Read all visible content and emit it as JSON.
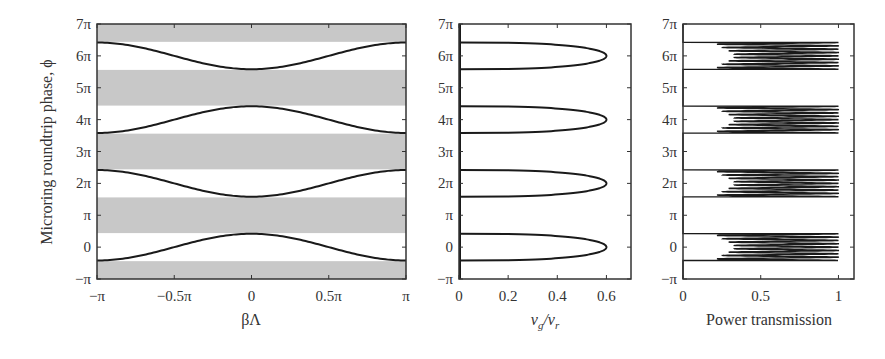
{
  "figure": {
    "ylabel": "Microring roundtrip phase, ϕ",
    "panels": [
      {
        "id": "a",
        "xlabel": "βΛ"
      },
      {
        "id": "b",
        "xlabel_main": "ν",
        "xlabel_sub1": "g",
        "xlabel_sep": "/ν",
        "xlabel_sub2": "r"
      },
      {
        "id": "c",
        "xlabel": "Power transmission"
      }
    ]
  },
  "chart_data": [
    {
      "type": "line",
      "title": "",
      "xlabel": "βΛ",
      "ylabel": "Microring roundtrip phase, ϕ",
      "xlim": [
        -3.14159,
        3.14159
      ],
      "ylim_pi": [
        -1,
        7
      ],
      "x_ticks": [
        -1,
        -0.5,
        0,
        0.5,
        1
      ],
      "x_tick_labels": [
        "−π",
        "−0.5π",
        "0",
        "0.5π",
        "π"
      ],
      "y_ticks_pi": [
        -1,
        0,
        1,
        2,
        3,
        4,
        5,
        6,
        7
      ],
      "y_tick_labels": [
        "−π",
        "0",
        "π",
        "2π",
        "3π",
        "4π",
        "5π",
        "6π",
        "7π"
      ],
      "band_gaps_shaded_pi": [
        [
          -1,
          -0.44
        ],
        [
          0.44,
          1.56
        ],
        [
          2.44,
          3.56
        ],
        [
          4.44,
          5.56
        ],
        [
          6.44,
          7
        ]
      ],
      "band_gap_color": "#c8c8c8",
      "series": [
        {
          "name": "band 0",
          "center_pi": 0,
          "amplitude_pi": 0.42,
          "sign": -1,
          "note": "0.42π at edges, −0.42π at center"
        },
        {
          "name": "band 2π",
          "center_pi": 2,
          "amplitude_pi": 0.42,
          "sign": 1
        },
        {
          "name": "band 4π",
          "center_pi": 4,
          "amplitude_pi": 0.42,
          "sign": -1
        },
        {
          "name": "band 6π",
          "center_pi": 6,
          "amplitude_pi": 0.42,
          "sign": 1
        }
      ],
      "grid": false
    },
    {
      "type": "line",
      "xlabel": "νg/νr",
      "xlim": [
        0,
        0.7
      ],
      "x_ticks": [
        0,
        0.2,
        0.4,
        0.6
      ],
      "x_tick_labels": [
        "0",
        "0.2",
        "0.4",
        "0.6"
      ],
      "y_ticks_pi": [
        -1,
        0,
        1,
        2,
        3,
        4,
        5,
        6,
        7
      ],
      "y_tick_labels": [
        "−π",
        "0",
        "π",
        "2π",
        "3π",
        "4π",
        "5π",
        "6π",
        "7π"
      ],
      "series": [
        {
          "name": "group velocity lobe",
          "centers_pi": [
            0,
            2,
            4,
            6
          ],
          "half_width_pi": 0.42,
          "peak": 0.6
        }
      ],
      "grid": false
    },
    {
      "type": "line",
      "xlabel": "Power transmission",
      "xlim": [
        0,
        1.1
      ],
      "x_ticks": [
        0,
        0.5,
        1
      ],
      "x_tick_labels": [
        "0",
        "0.5",
        "1"
      ],
      "y_ticks_pi": [
        -1,
        0,
        1,
        2,
        3,
        4,
        5,
        6,
        7
      ],
      "y_tick_labels": [
        "−π",
        "0",
        "π",
        "2π",
        "3π",
        "4π",
        "5π",
        "6π",
        "7π"
      ],
      "series": [
        {
          "name": "transmission",
          "passbands_center_pi": [
            0,
            2,
            4,
            6
          ],
          "half_width_pi": 0.42,
          "min_in_band": 0.2,
          "max": 1.0,
          "ripple_peaks_per_band": 8
        }
      ],
      "grid": false
    }
  ]
}
